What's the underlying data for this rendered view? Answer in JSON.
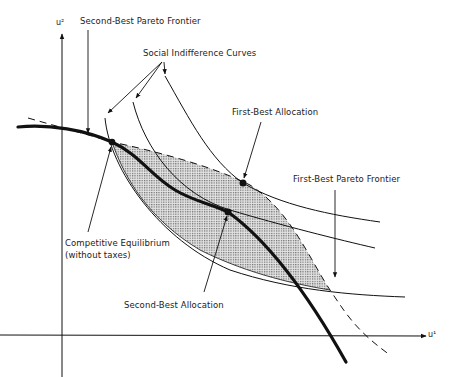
{
  "diagram": {
    "axes": {
      "x_label": "u¹",
      "y_label": "u²"
    },
    "labels": {
      "second_best_frontier": "Second-Best Pareto Frontier",
      "social_indifference": "Social Indifference Curves",
      "first_best_allocation": "First-Best Allocation",
      "first_best_frontier": "First-Best Pareto Frontier",
      "competitive_eq_line1": "Competitive Equilibrium",
      "competitive_eq_line2": "(without taxes)",
      "second_best_allocation": "Second-Best Allocation"
    },
    "colors": {
      "ink": "#111111",
      "shade": "#bdbdbd",
      "background": "#ffffff"
    },
    "points": {
      "competitive_equilibrium": [
        112,
        142
      ],
      "first_best_allocation": [
        243,
        183
      ],
      "second_best_allocation": [
        228,
        212
      ]
    }
  }
}
